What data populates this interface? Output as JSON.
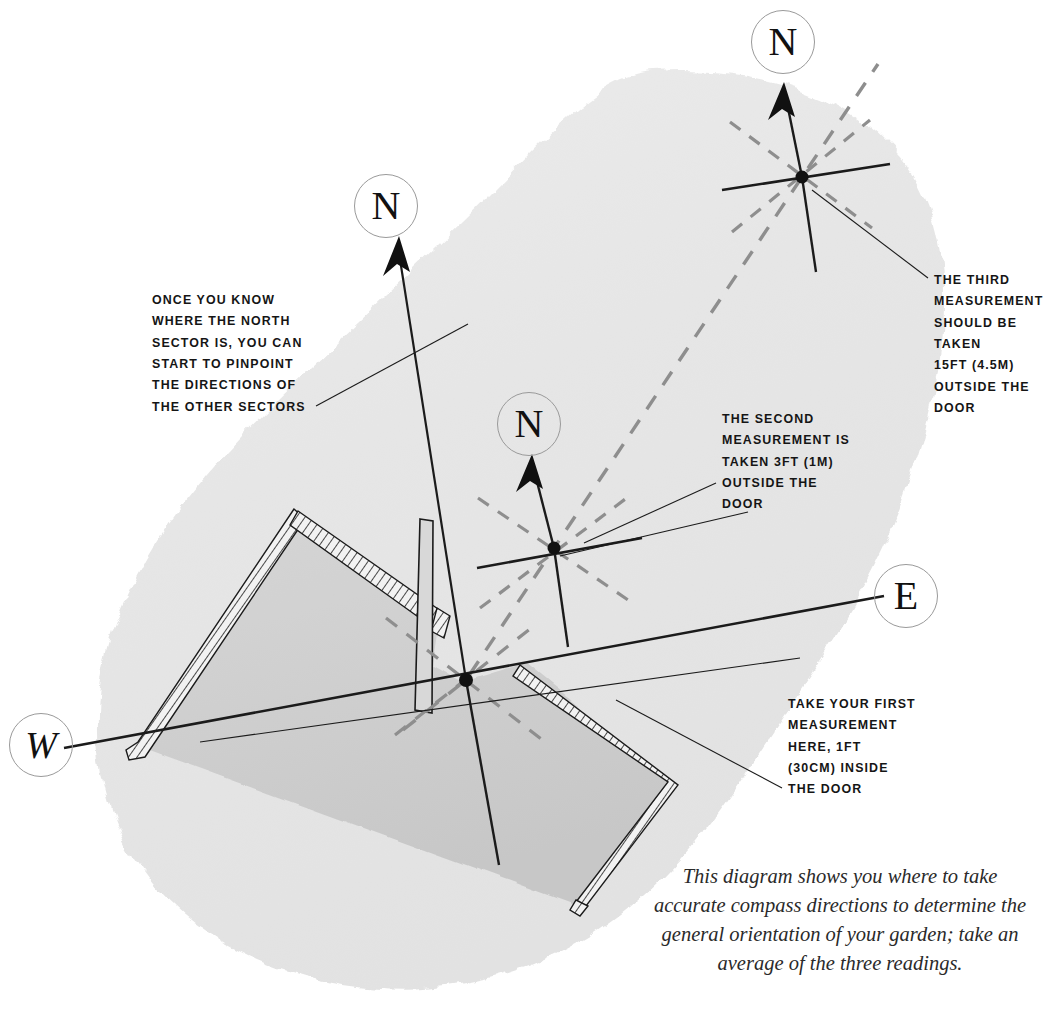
{
  "diagram": {
    "caption": "This diagram shows you where to\ntake accurate compass directions to\ndetermine the general orientation\nof your garden; take an average of\nthe three readings."
  },
  "direction_marks": {
    "north_main": "N",
    "north_second": "N",
    "north_third": "N",
    "east": "E",
    "west": "W"
  },
  "notes": {
    "sectors": "ONCE YOU KNOW\nWHERE THE NORTH\nSECTOR IS, YOU CAN\nSTART TO PINPOINT\nTHE DIRECTIONS OF\nTHE OTHER SECTORS",
    "third_measurement": "THE THIRD\nMEASUREMENT\nSHOULD BE TAKEN\n15FT (4.5M)\nOUTSIDE THE\nDOOR",
    "second_measurement": "THE SECOND\nMEASUREMENT IS\nTAKEN 3FT (1M)\nOUTSIDE THE\nDOOR",
    "first_measurement": "TAKE YOUR FIRST\nMEASUREMENT\nHERE, 1FT\n(30CM) INSIDE\nTHE DOOR"
  },
  "measurements": [
    {
      "order": 1,
      "label": "first",
      "distance_ft": "1FT",
      "distance_metric": "30CM",
      "position": "inside the door"
    },
    {
      "order": 2,
      "label": "second",
      "distance_ft": "3FT",
      "distance_metric": "1M",
      "position": "outside the door"
    },
    {
      "order": 3,
      "label": "third",
      "distance_ft": "15FT",
      "distance_metric": "4.5M",
      "position": "outside the door"
    }
  ],
  "colors": {
    "paper": "#ffffff",
    "wash": "#e9e9e9",
    "house_fill": "#cfcfcf",
    "ink": "#1b1b1b",
    "circle_stroke": "#9a9a9a",
    "dashed": "#8e8e8e"
  }
}
